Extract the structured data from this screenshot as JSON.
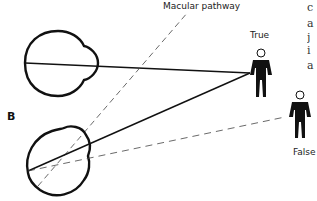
{
  "labels": {
    "macular_pathway": "Macular pathway",
    "true": "True",
    "false": "False",
    "panel": "B"
  },
  "clipped_text_lines": [
    "c",
    "a",
    "j",
    "i",
    "a"
  ]
}
